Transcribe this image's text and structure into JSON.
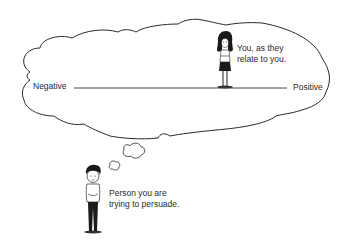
{
  "diagram": {
    "type": "persuasion-perception-scale",
    "thought_cloud": {
      "axis": {
        "left_label": "Negative",
        "right_label": "Positive"
      },
      "figure_you": {
        "caption_line1": "You, as they",
        "caption_line2": "relate to you.",
        "position_on_axis": "slightly right of center (positive side)"
      }
    },
    "thinker": {
      "caption_line1": "Person you are",
      "caption_line2": "trying to persuade."
    },
    "colors": {
      "background": "#ffffff",
      "stroke": "#2a2a2a",
      "text": "#2a2a2a"
    }
  }
}
